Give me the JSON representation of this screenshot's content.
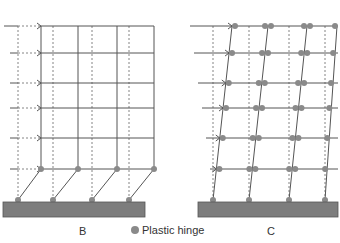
{
  "figures": [
    {
      "id": "B",
      "label": "B",
      "description": "Soft-storey mechanism: plastic hinges form at top and bottom of ground-floor columns",
      "floors_y": [
        26,
        53,
        83,
        108,
        138,
        169
      ],
      "columns_displaced_x": [
        41,
        78,
        117,
        154
      ],
      "columns_original_x": [
        18,
        53,
        92,
        129
      ],
      "base_y": 200,
      "slab": {
        "x": 3,
        "y": 202,
        "width": 142,
        "height": 15
      }
    },
    {
      "id": "C",
      "label": "C",
      "description": "Beam-sway mechanism: plastic hinges form at beam ends on every floor and at column bases",
      "floors_y": [
        26,
        53,
        83,
        108,
        138,
        169
      ],
      "columns_top_x": [
        232,
        268,
        307,
        337
      ],
      "columns_base_x": [
        213,
        249,
        289,
        325
      ],
      "columns_original_x": [
        213,
        249,
        289,
        325
      ],
      "base_y": 200,
      "slab": {
        "x": 198,
        "y": 202,
        "width": 140,
        "height": 15
      }
    }
  ],
  "legend": {
    "marker": "circle",
    "label": "Plastic hinge",
    "color": "#8a8a8a"
  },
  "colors": {
    "line": "#555555",
    "dashed": "#666666",
    "hinge": "#8a8a8a",
    "slab_fill": "#7d7d7d",
    "slab_stroke": "#555555"
  }
}
